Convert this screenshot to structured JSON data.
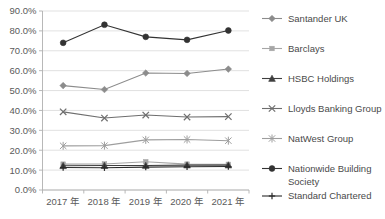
{
  "chart_data": {
    "type": "line",
    "title": "",
    "subtitle": "",
    "xlabel": "",
    "ylabel": "",
    "categories": [
      "2017 年",
      "2018 年",
      "2019 年",
      "2020 年",
      "2021 年"
    ],
    "ylim": [
      0,
      90
    ],
    "ytick_labels": [
      "0.0%",
      "10.0%",
      "20.0%",
      "30.0%",
      "40.0%",
      "50.0%",
      "60.0%",
      "70.0%",
      "80.0%",
      "90.0%"
    ],
    "ytick_values": [
      0,
      10,
      20,
      30,
      40,
      50,
      60,
      70,
      80,
      90
    ],
    "grid": true,
    "legend_position": "right",
    "series": [
      {
        "name": "Santander UK",
        "values": [
          52.5,
          50.5,
          58.8,
          58.6,
          60.8
        ],
        "color": "#8c8c8c",
        "marker": "diamond"
      },
      {
        "name": "Barclays",
        "values": [
          13.0,
          13.1,
          14.2,
          13.0,
          12.9
        ],
        "color": "#a6a6a6",
        "marker": "square"
      },
      {
        "name": "HSBC Holdings",
        "values": [
          12.2,
          12.3,
          12.3,
          12.5,
          12.5
        ],
        "color": "#3f3f3f",
        "marker": "triangle"
      },
      {
        "name": "Lloyds Banking Group",
        "values": [
          39.3,
          36.2,
          37.7,
          36.7,
          36.9
        ],
        "color": "#6e6e6e",
        "marker": "x"
      },
      {
        "name": "NatWest Group",
        "values": [
          22.2,
          22.3,
          25.2,
          25.4,
          24.8
        ],
        "color": "#9e9e9e",
        "marker": "star"
      },
      {
        "name": "Nationwide Building Society",
        "values": [
          74.0,
          83.1,
          77.0,
          75.5,
          80.2
        ],
        "color": "#333333",
        "marker": "circle"
      },
      {
        "name": "Standard Chartered",
        "values": [
          11.3,
          11.2,
          11.5,
          11.7,
          11.8
        ],
        "color": "#2b2b2b",
        "marker": "plus"
      }
    ],
    "legend_entries": [
      {
        "label": "Santander UK",
        "lines": [
          "Santander UK"
        ]
      },
      {
        "label": "Barclays",
        "lines": [
          "Barclays"
        ]
      },
      {
        "label": "HSBC Holdings",
        "lines": [
          "HSBC Holdings"
        ]
      },
      {
        "label": "Lloyds Banking Group",
        "lines": [
          "Lloyds Banking Group"
        ]
      },
      {
        "label": "NatWest Group",
        "lines": [
          "NatWest Group"
        ]
      },
      {
        "label": "Nationwide Building Society",
        "lines": [
          "Nationwide Building",
          "Society"
        ]
      },
      {
        "label": "Standard Chartered",
        "lines": [
          "Standard Chartered"
        ]
      }
    ]
  },
  "colors": {
    "gridline": "#d9d9d9",
    "axis": "#b0b0b0",
    "tick_text": "#5a5a5a",
    "legend_text": "#4a4a4a",
    "background": "#ffffff"
  }
}
